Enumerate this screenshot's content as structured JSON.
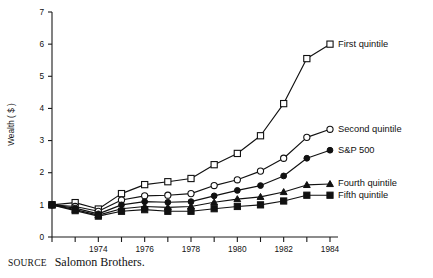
{
  "source": {
    "keyword": "SOURCE",
    "text": "Salomon Brothers."
  },
  "chart_data": {
    "type": "line",
    "title": "",
    "xlabel": "",
    "ylabel": "Wealth ( $ )",
    "xlim": [
      1972,
      1984
    ],
    "ylim": [
      0,
      7
    ],
    "yticks": [
      0,
      1,
      2,
      3,
      4,
      5,
      6,
      7
    ],
    "ytick_labels": [
      "0",
      "1",
      "2",
      "3",
      "4",
      "5",
      "6",
      "7"
    ],
    "xticks": [
      1972,
      1973,
      1974,
      1975,
      1976,
      1977,
      1978,
      1979,
      1980,
      1981,
      1982,
      1983,
      1984
    ],
    "xtick_labels": [
      "",
      "",
      "1974",
      "",
      "1976",
      "",
      "1978",
      "",
      "1980",
      "",
      "1982",
      "",
      "1984"
    ],
    "grid": false,
    "legend_position": "inline-right",
    "x": [
      1972,
      1973,
      1974,
      1975,
      1976,
      1977,
      1978,
      1979,
      1980,
      1981,
      1982,
      1983,
      1984
    ],
    "series": [
      {
        "name": "First quintile",
        "marker": "open-square",
        "values": [
          1.0,
          1.07,
          0.87,
          1.35,
          1.63,
          1.72,
          1.82,
          2.25,
          2.6,
          3.15,
          4.15,
          5.55,
          6.0
        ]
      },
      {
        "name": "Second quintile",
        "marker": "open-circle",
        "values": [
          1.0,
          0.95,
          0.8,
          1.15,
          1.28,
          1.3,
          1.35,
          1.6,
          1.78,
          2.05,
          2.45,
          3.1,
          3.35
        ]
      },
      {
        "name": "S&P 500",
        "marker": "filled-circle",
        "values": [
          1.0,
          0.9,
          0.72,
          1.0,
          1.1,
          1.08,
          1.1,
          1.28,
          1.45,
          1.6,
          1.9,
          2.45,
          2.7
        ]
      },
      {
        "name": "Fourth quintile",
        "marker": "filled-triangle",
        "values": [
          1.0,
          0.85,
          0.68,
          0.88,
          0.95,
          0.92,
          0.95,
          1.08,
          1.18,
          1.25,
          1.4,
          1.62,
          1.65
        ]
      },
      {
        "name": "Fifth quintile",
        "marker": "filled-square",
        "values": [
          1.0,
          0.82,
          0.65,
          0.8,
          0.85,
          0.8,
          0.8,
          0.88,
          0.95,
          1.0,
          1.12,
          1.3,
          1.3
        ]
      }
    ]
  }
}
